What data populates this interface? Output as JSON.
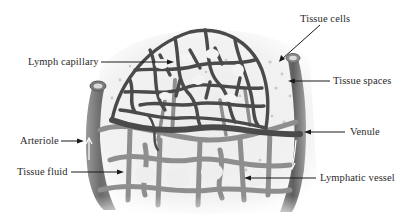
{
  "diagram": {
    "type": "anatomical-illustration",
    "colors": {
      "background": "#ffffff",
      "lymph_network": "#4a4a4a",
      "blood_capillaries": "#8a8a8a",
      "tissue_space": "#f2f2f2",
      "vessel_wall": "#6e6e6e",
      "label_text": "#2a2a2a",
      "leader_line": "#1a1a1a"
    },
    "labels": [
      {
        "id": "tissue-cells",
        "text": "Tissue cells"
      },
      {
        "id": "lymph-capillary",
        "text": "Lymph capillary"
      },
      {
        "id": "tissue-spaces",
        "text": "Tissue spaces"
      },
      {
        "id": "arteriole",
        "text": "Arteriole"
      },
      {
        "id": "venule",
        "text": "Venule"
      },
      {
        "id": "tissue-fluid",
        "text": "Tissue fluid"
      },
      {
        "id": "lymphatic-vessel",
        "text": "Lymphatic vessel"
      }
    ]
  }
}
